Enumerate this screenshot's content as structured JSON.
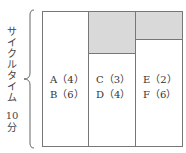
{
  "axis": {
    "label_chars": [
      "サ",
      "イ",
      "ク",
      "ル",
      "タ",
      "イ",
      "ム"
    ],
    "time_value": "10",
    "time_unit": "分"
  },
  "stations": [
    {
      "tasks": [
        "A（4）",
        "B（6）"
      ],
      "total": 10,
      "idle": 0
    },
    {
      "tasks": [
        "C（3）",
        "D（4）"
      ],
      "total": 7,
      "idle": 3
    },
    {
      "tasks": [
        "E（2）",
        "F（6）"
      ],
      "total": 8,
      "idle": 2
    }
  ],
  "colors": {
    "idle_fill": "#d9d9d9",
    "border": "#777777"
  }
}
